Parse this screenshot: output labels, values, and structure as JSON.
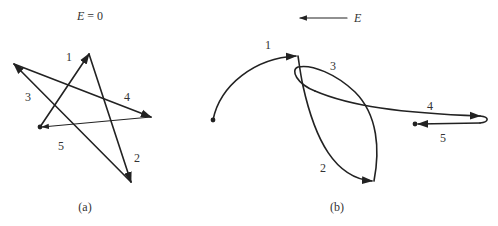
{
  "panel_a": {
    "title": "E = 0",
    "title_var": "E",
    "title_rest": " = 0",
    "caption": "(a)",
    "segment_labels": [
      "1",
      "2",
      "3",
      "4",
      "5"
    ]
  },
  "panel_b": {
    "field_label": "E",
    "field_direction": "left",
    "caption": "(b)",
    "segment_labels": [
      "1",
      "2",
      "3",
      "4",
      "5"
    ]
  },
  "colors": {
    "stroke": "#222222",
    "text": "#333333",
    "background": "#ffffff"
  }
}
